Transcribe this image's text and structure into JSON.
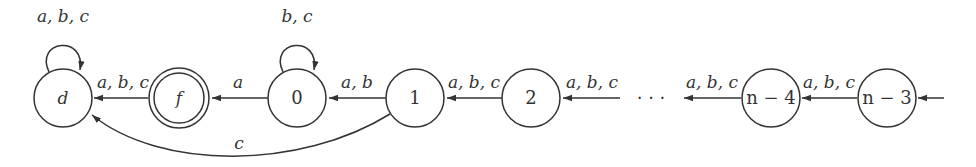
{
  "diagram": {
    "type": "finite-automaton",
    "nodes": [
      {
        "id": "d",
        "label": "d",
        "italic": true,
        "accepting": false
      },
      {
        "id": "f",
        "label": "f",
        "italic": true,
        "accepting": true
      },
      {
        "id": "q0",
        "label": "0",
        "italic": false,
        "accepting": false
      },
      {
        "id": "q1",
        "label": "1",
        "italic": false,
        "accepting": false
      },
      {
        "id": "q2",
        "label": "2",
        "italic": false,
        "accepting": false
      },
      {
        "id": "qn4",
        "label": "n − 4",
        "italic": false,
        "accepting": false
      },
      {
        "id": "qn3",
        "label": "n − 3",
        "italic": false,
        "accepting": false
      }
    ],
    "edges": [
      {
        "from": "d",
        "to": "d",
        "label": "a, b, c",
        "kind": "self-loop"
      },
      {
        "from": "f",
        "to": "d",
        "label": "a, b, c"
      },
      {
        "from": "q0",
        "to": "q0",
        "label": "b, c",
        "kind": "self-loop"
      },
      {
        "from": "q0",
        "to": "f",
        "label": "a"
      },
      {
        "from": "q1",
        "to": "q0",
        "label": "a, b"
      },
      {
        "from": "q1",
        "to": "d",
        "label": "c",
        "kind": "curved"
      },
      {
        "from": "q2",
        "to": "q1",
        "label": "a, b, c"
      },
      {
        "from": "ellipsis",
        "to": "q2",
        "label": "a, b, c"
      },
      {
        "from": "qn4",
        "to": "ellipsis",
        "label": "a, b, c"
      },
      {
        "from": "qn3",
        "to": "qn4",
        "label": "a, b, c"
      },
      {
        "from": "start",
        "to": "qn3",
        "label": "",
        "kind": "initial"
      }
    ],
    "ellipsis": "· · ·"
  }
}
